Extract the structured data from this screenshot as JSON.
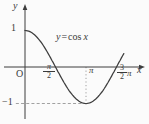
{
  "chart_data": {
    "type": "line",
    "function_label": "y = cos x",
    "x_axis_label": "x",
    "y_axis_label": "y",
    "origin_label": "O",
    "x_ticks": [
      {
        "label": "π/2",
        "value_in_pi": 0.5
      },
      {
        "label": "π",
        "value_in_pi": 1
      },
      {
        "label": "3π/2",
        "value_in_pi": 1.5
      }
    ],
    "y_ticks": [
      {
        "label": "1",
        "value": 1
      },
      {
        "label": "−1",
        "value": -1
      }
    ],
    "x_domain_in_pi": [
      0,
      1.62
    ],
    "ylim": [
      -1,
      1
    ],
    "grid": false,
    "legend": false,
    "series": [
      {
        "name": "cos",
        "function": "cos(x)"
      }
    ],
    "key_points_in_pi": [
      [
        0,
        1
      ],
      [
        0.5,
        0
      ],
      [
        1,
        -1
      ],
      [
        1.5,
        0
      ]
    ],
    "guides": [
      {
        "type": "dashed-horizontal",
        "y": -1,
        "from_x_in_pi": -0.15,
        "to_x_in_pi": 1
      },
      {
        "type": "dotted-vertical",
        "x_in_pi": 1,
        "from_y": 0,
        "to_y": -1
      }
    ],
    "mapping": {
      "origin_px": [
        25,
        67
      ],
      "px_per_pi_x": 61,
      "px_per_unit_y": 36.5,
      "curve_end_in_pi": 1.62,
      "axis_x_extent_px": [
        4,
        145
      ],
      "axis_y_extent_px": [
        4,
        119
      ]
    }
  },
  "labels": {
    "y_axis": "y",
    "x_axis": "x",
    "origin": "O",
    "y_max": "1",
    "y_min": "−1",
    "pi_tick": "π",
    "pi_over_2": {
      "numerator": "π",
      "denominator": "2"
    },
    "three_halves_pi": {
      "numerator": "3",
      "denominator": "2",
      "suffix": "π"
    },
    "curve": {
      "lhs": "y",
      "eq": "=",
      "fn": "cos",
      "arg": "x"
    }
  },
  "colors": {
    "stroke": "#3d3d3d",
    "text": "#3a3a3a",
    "guide": "#8a8a8a",
    "background": "#fbfbfb"
  }
}
